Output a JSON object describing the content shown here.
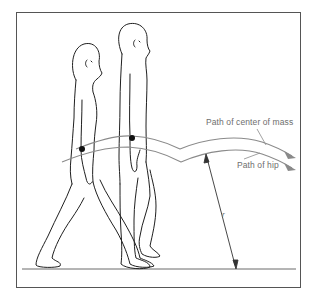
{
  "figure": {
    "labels": {
      "center_of_mass_path": "Path of center of mass",
      "hip_path": "Path of hip",
      "radius": "r"
    },
    "markers": [
      {
        "name": "center-of-mass-dot-rear-figure",
        "x": 82,
        "y": 149
      },
      {
        "name": "center-of-mass-dot-front-figure",
        "x": 132,
        "y": 138
      }
    ],
    "colors": {
      "frame": "#555555",
      "figure_outline": "#1f1f1f",
      "path_stroke": "#8a8a8a",
      "arrowhead": "#8a8a8a",
      "ground": "#6a6a6a",
      "label_text": "#6e6e6e",
      "dot": "#111111"
    }
  }
}
